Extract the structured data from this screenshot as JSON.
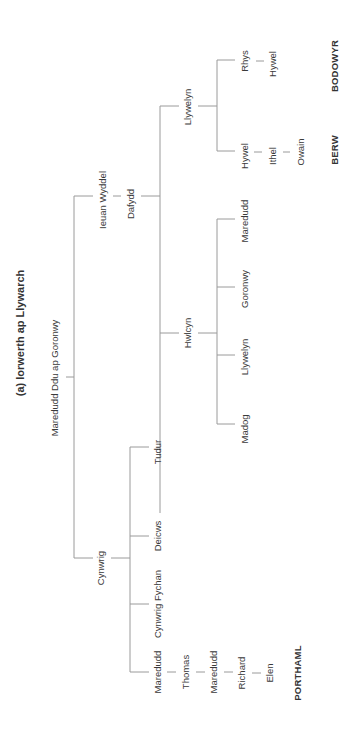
{
  "diagram": {
    "title": "(a)  Iorwerth ap Llywarch",
    "orientation": "rotated 90deg counter-clockwise",
    "root": "Maredudd Ddu ap Goronwy",
    "people": {
      "maredudd_ddu": "Maredudd Ddu ap Goronwy",
      "ieuan_wyddel": "Ieuan Wyddel",
      "dafydd": "Dafydd",
      "llywelyn_1": "Llywelyn",
      "rhys": "Rhys",
      "hywel_bodowyr": "Hywel",
      "hywel_berw": "Hywel",
      "ithel": "Ithel",
      "owain": "Owain",
      "hwlcyn": "Hwlcyn",
      "maredudd_h": "Maredudd",
      "goronwy": "Goronwy",
      "llywelyn_h": "Llywelyn",
      "madog": "Madog",
      "cynwrig": "Cynwrig",
      "tudur": "Tudur",
      "deicws": "Deicws",
      "cynwrig_fychan": "Cynwrig Fychan",
      "maredudd_p1": "Maredudd",
      "thomas": "Thomas",
      "maredudd_p2": "Maredudd",
      "richard": "Richard",
      "elen": "Elen"
    },
    "places": {
      "bodowyr": "BODOWYR",
      "berw": "BERW",
      "porthaml": "PORTHAML"
    },
    "colors": {
      "line": "#9a9a9a",
      "text": "#3a3a3a",
      "background": "#ffffff"
    }
  }
}
